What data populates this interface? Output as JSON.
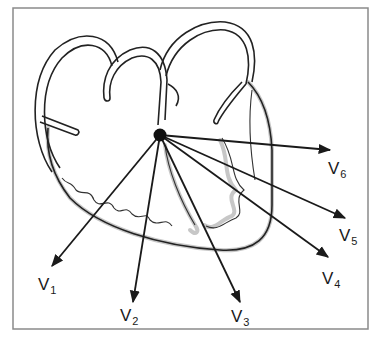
{
  "diagram": {
    "origin": {
      "x": 160,
      "y": 135
    },
    "leads": [
      {
        "id": "V1",
        "base": "V",
        "sub": "1",
        "tip": {
          "x": 52,
          "y": 266
        },
        "label_pos": {
          "x": 38,
          "y": 276
        }
      },
      {
        "id": "V2",
        "base": "V",
        "sub": "2",
        "tip": {
          "x": 133,
          "y": 302
        },
        "label_pos": {
          "x": 120,
          "y": 307
        }
      },
      {
        "id": "V3",
        "base": "V",
        "sub": "3",
        "tip": {
          "x": 240,
          "y": 302
        },
        "label_pos": {
          "x": 231,
          "y": 308
        }
      },
      {
        "id": "V4",
        "base": "V",
        "sub": "4",
        "tip": {
          "x": 328,
          "y": 257
        },
        "label_pos": {
          "x": 322,
          "y": 270
        }
      },
      {
        "id": "V5",
        "base": "V",
        "sub": "5",
        "tip": {
          "x": 345,
          "y": 218
        },
        "label_pos": {
          "x": 339,
          "y": 227
        }
      },
      {
        "id": "V6",
        "base": "V",
        "sub": "6",
        "tip": {
          "x": 330,
          "y": 150
        },
        "label_pos": {
          "x": 328,
          "y": 160
        }
      }
    ],
    "colors": {
      "line": "#1a1a1a",
      "frame": "#8a8a8a",
      "shade": "#bdbdbd",
      "background": "#ffffff"
    }
  }
}
